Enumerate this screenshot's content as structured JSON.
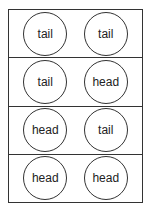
{
  "rows": [
    {
      "coins": [
        "tail",
        "tail"
      ]
    },
    {
      "coins": [
        "tail",
        "head"
      ]
    },
    {
      "coins": [
        "head",
        "tail"
      ]
    },
    {
      "coins": [
        "head",
        "head"
      ]
    }
  ]
}
